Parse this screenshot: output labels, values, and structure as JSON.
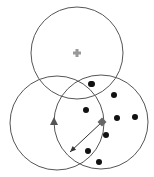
{
  "diagram": {
    "colors": {
      "circle_stroke": "#555555",
      "dot": "#111111",
      "plus": "#999999",
      "triangle": "#555555",
      "diamond": "#666666",
      "arrow": "#333333"
    },
    "circles": [
      {
        "name": "top-circle",
        "cx": 77,
        "cy": 53,
        "r": 46
      },
      {
        "name": "left-circle",
        "cx": 57,
        "cy": 123,
        "r": 47
      },
      {
        "name": "right-circle",
        "cx": 101,
        "cy": 122,
        "r": 47
      }
    ],
    "plus": {
      "x": 77,
      "y": 53
    },
    "triangle": {
      "x": 54,
      "y": 122
    },
    "diamond": {
      "x": 102,
      "y": 122
    },
    "arrow": {
      "x1": 102,
      "y1": 122,
      "x2": 70,
      "y2": 152
    },
    "dots": [
      {
        "x": 91,
        "y": 84
      },
      {
        "x": 92,
        "y": 84
      },
      {
        "x": 91,
        "y": 84
      },
      {
        "x": 114,
        "y": 95
      },
      {
        "x": 86,
        "y": 110
      },
      {
        "x": 117,
        "y": 118
      },
      {
        "x": 135,
        "y": 117
      },
      {
        "x": 106,
        "y": 135
      },
      {
        "x": 88,
        "y": 151
      },
      {
        "x": 99,
        "y": 162
      }
    ]
  }
}
